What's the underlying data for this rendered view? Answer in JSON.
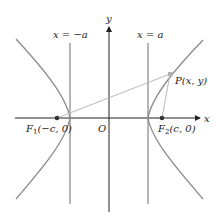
{
  "figure": {
    "type": "hyperbola-foci-diagram",
    "axes": {
      "x_label": "x",
      "y_label": "y",
      "origin_label": "O"
    },
    "directrix_lines": {
      "left_label": "x = −a",
      "right_label": "x = a"
    },
    "foci": {
      "f1": {
        "name": "F",
        "sub": "1",
        "coords": "(−c, 0)"
      },
      "f2": {
        "name": "F",
        "sub": "2",
        "coords": "(c, 0)"
      }
    },
    "point": {
      "name": "P",
      "coords": "(x, y)"
    },
    "colors": {
      "axis": "#222222",
      "curve": "#8a8a8a",
      "vertical_line": "#6e6e6e",
      "focal_segment": "#b8b8b8",
      "point_p": "#b0b0b0",
      "focus_dot": "#333333"
    }
  }
}
